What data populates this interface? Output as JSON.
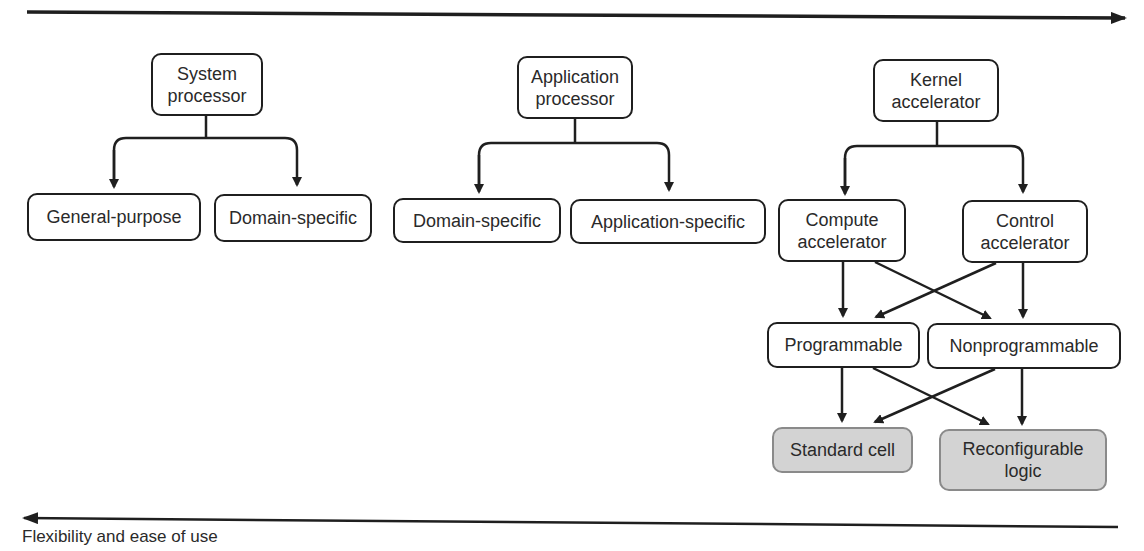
{
  "figure": {
    "top_axis": {
      "direction": "right",
      "label": ""
    },
    "bottom_axis": {
      "direction": "left",
      "label": "Flexibility and ease of use"
    },
    "colors": {
      "line": "#1f1f1f",
      "node_fill": "#ffffff",
      "shaded_fill": "#d3d3d3",
      "shaded_border": "#8a8a8a",
      "text": "#2a2a2a"
    }
  },
  "groups": [
    {
      "root": {
        "label": "System\nprocessor"
      },
      "children": [
        {
          "label": "General-purpose"
        },
        {
          "label": "Domain-specific"
        }
      ]
    },
    {
      "root": {
        "label": "Application\nprocessor"
      },
      "children": [
        {
          "label": "Domain-specific"
        },
        {
          "label": "Application-specific"
        }
      ]
    },
    {
      "root": {
        "label": "Kernel\naccelerator"
      },
      "children": [
        {
          "label": "Compute\naccelerator"
        },
        {
          "label": "Control\naccelerator"
        }
      ],
      "level2": [
        {
          "label": "Programmable"
        },
        {
          "label": "Nonprogrammable"
        }
      ],
      "level3": [
        {
          "label": "Standard cell",
          "shaded": true
        },
        {
          "label": "Reconfigurable\nlogic",
          "shaded": true
        }
      ]
    }
  ],
  "edges": [
    {
      "from": "System processor",
      "to": "General-purpose"
    },
    {
      "from": "System processor",
      "to": "Domain-specific"
    },
    {
      "from": "Application processor",
      "to": "Domain-specific"
    },
    {
      "from": "Application processor",
      "to": "Application-specific"
    },
    {
      "from": "Kernel accelerator",
      "to": "Compute accelerator"
    },
    {
      "from": "Kernel accelerator",
      "to": "Control accelerator"
    },
    {
      "from": "Compute accelerator",
      "to": "Programmable"
    },
    {
      "from": "Compute accelerator",
      "to": "Nonprogrammable"
    },
    {
      "from": "Control accelerator",
      "to": "Programmable"
    },
    {
      "from": "Control accelerator",
      "to": "Nonprogrammable"
    },
    {
      "from": "Programmable",
      "to": "Standard cell"
    },
    {
      "from": "Programmable",
      "to": "Reconfigurable logic"
    },
    {
      "from": "Nonprogrammable",
      "to": "Standard cell"
    },
    {
      "from": "Nonprogrammable",
      "to": "Reconfigurable logic"
    }
  ]
}
